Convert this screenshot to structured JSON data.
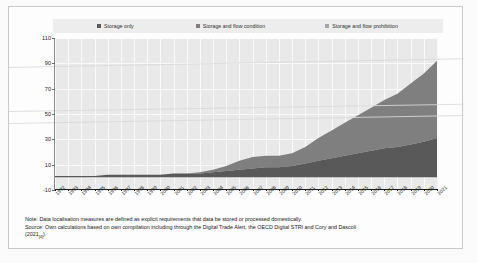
{
  "figure": {
    "legend": {
      "items": [
        {
          "label": "Storage only",
          "color": "#595959"
        },
        {
          "label": "Storage and flow condition",
          "color": "#7f7f7f"
        },
        {
          "label": "Storage and flow prohibition",
          "color": "#a6a6a6"
        }
      ]
    },
    "notes": {
      "note": "Note: Data localisation measures are defined as explicit requirements that data be stored or processed domestically.",
      "source": "Source: Own calculations based on own compilation including through the Digital Trade Alert, the OECD Digital STRI and Cory and Dascoli",
      "citation_year": "(2021",
      "citation_ref": "[4]",
      "citation_close": ").",
      "source_tail": ""
    }
  },
  "chart_data": {
    "type": "area",
    "title": "",
    "subtitle": "",
    "xlabel": "",
    "ylabel": "",
    "stacked": true,
    "grid": true,
    "legend_position": "top",
    "ylim": [
      -10,
      110
    ],
    "yticks": [
      110,
      90,
      70,
      50,
      30,
      10,
      -10
    ],
    "ytick_labels": [
      "110",
      "90",
      "70",
      "50",
      "30",
      "10",
      "-10"
    ],
    "categories": [
      "1992",
      "1993",
      "1994",
      "1995",
      "1996",
      "1997",
      "1998",
      "1999",
      "2000",
      "2001",
      "2002",
      "2003",
      "2004",
      "2005",
      "2006",
      "2007",
      "2008",
      "2009",
      "2010",
      "2011",
      "2012",
      "2013",
      "2014",
      "2015",
      "2016",
      "2017",
      "2018",
      "2019",
      "2020",
      "2021"
    ],
    "series": [
      {
        "name": "Storage only",
        "color": "#595959",
        "values": [
          1,
          1,
          1,
          1,
          2,
          2,
          2,
          2,
          2,
          3,
          3,
          3,
          4,
          5,
          6,
          7,
          8,
          8,
          9,
          11,
          13,
          15,
          17,
          19,
          21,
          23,
          24,
          26,
          28,
          31
        ]
      },
      {
        "name": "Storage and flow condition",
        "color": "#7f7f7f",
        "values": [
          0,
          0,
          0,
          0,
          0,
          0,
          0,
          0,
          0,
          0,
          0,
          1,
          2,
          4,
          7,
          9,
          9,
          9,
          10,
          13,
          18,
          22,
          26,
          30,
          34,
          38,
          42,
          48,
          54,
          61
        ]
      },
      {
        "name": "Storage and flow prohibition",
        "color": "#a6a6a6",
        "values": [
          0,
          0,
          0,
          0,
          0,
          0,
          0,
          0,
          0,
          0,
          0,
          0,
          0,
          0,
          0,
          0,
          0,
          0,
          0,
          0,
          0,
          0,
          0,
          0,
          0,
          0,
          0,
          0,
          0,
          0
        ]
      }
    ],
    "totals": [
      1,
      1,
      1,
      1,
      2,
      2,
      2,
      2,
      2,
      3,
      3,
      4,
      6,
      9,
      13,
      16,
      17,
      17,
      19,
      24,
      31,
      37,
      43,
      49,
      55,
      61,
      66,
      74,
      82,
      92
    ]
  }
}
